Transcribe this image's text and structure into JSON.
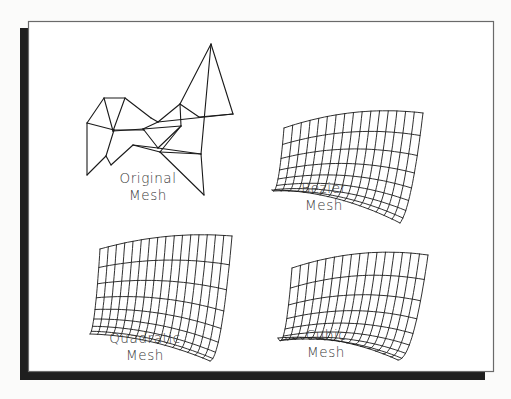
{
  "figure": {
    "title": "",
    "panels": [
      {
        "id": "original",
        "type": "control-net",
        "label_line1": "Original",
        "label_line2": "Mesh"
      },
      {
        "id": "bezier",
        "type": "smooth-surface",
        "label_line1": "Bezier",
        "label_line2": "Mesh",
        "grid_u": 16,
        "grid_v": 8
      },
      {
        "id": "quadratic",
        "type": "smooth-surface",
        "label_line1": "Quadratic",
        "label_line2": "Mesh",
        "grid_u": 16,
        "grid_v": 8
      },
      {
        "id": "cubic",
        "type": "smooth-surface",
        "label_line1": "Cubic",
        "label_line2": "Mesh",
        "grid_u": 16,
        "grid_v": 8
      }
    ],
    "colors": {
      "line": "#1a1a1a",
      "label": "#3a3a3a",
      "shadow": "#1e1e1e",
      "frame": "#6a6a6a",
      "background": "#ffffff"
    }
  }
}
